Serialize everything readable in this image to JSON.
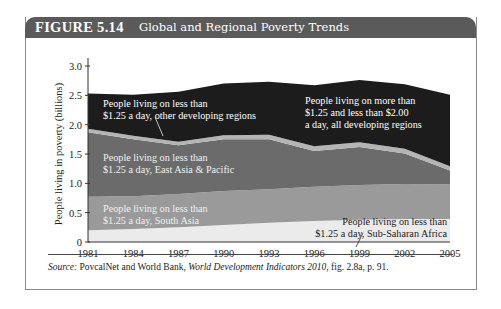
{
  "figure": {
    "number": "FIGURE 5.14",
    "title": "Global and Regional Poverty Trends",
    "header_color": "#5a5a5a"
  },
  "source": {
    "label": "Source:",
    "text_before": " PovcalNet and World Bank, ",
    "italic": "World Development Indicators 2010",
    "text_after": ", fig. 2.8a, p. 91."
  },
  "chart_data": {
    "type": "area",
    "stacked": true,
    "title": "Global and Regional Poverty Trends",
    "xlabel": "",
    "ylabel": "People living in poverty (billions)",
    "ylim": [
      0,
      3.0
    ],
    "yticks": [
      "0",
      "0.5",
      "1.0",
      "1.5",
      "2.0",
      "2.5",
      "3.0"
    ],
    "x": [
      1981,
      1984,
      1987,
      1990,
      1993,
      1996,
      1999,
      2002,
      2005
    ],
    "xtick_labels": [
      "1981",
      "1984",
      "1987",
      "1990",
      "1993",
      "1996",
      "1999",
      "2002",
      "2005"
    ],
    "grid": false,
    "legend_position": "inline labels",
    "series": [
      {
        "name": "People living on less than $1.25 a day, Sub-Saharan Africa",
        "label_lines": [
          "People living on less than",
          "$1.25 a day, Sub-Saharan Africa"
        ],
        "color": "#ebebeb",
        "values": [
          0.2,
          0.22,
          0.25,
          0.29,
          0.33,
          0.36,
          0.38,
          0.39,
          0.39
        ]
      },
      {
        "name": "People living on less than $1.25 a day, South Asia",
        "label_lines": [
          "People living on less than",
          "$1.25 a day, South Asia"
        ],
        "color": "#9a9a9a",
        "values": [
          0.57,
          0.56,
          0.57,
          0.58,
          0.57,
          0.58,
          0.59,
          0.6,
          0.59
        ]
      },
      {
        "name": "People living on less than $1.25 a day, East Asia & Pacific",
        "label_lines": [
          "People living on less than",
          "$1.25 a day, East Asia & Pacific"
        ],
        "color": "#6b6b6b",
        "values": [
          1.1,
          0.97,
          0.83,
          0.88,
          0.85,
          0.61,
          0.65,
          0.52,
          0.24
        ]
      },
      {
        "name": "People living on less than $1.25 a day, other developing regions",
        "label_lines": [
          "People living on less than",
          "$1.25 a day, other developing regions"
        ],
        "color": "#b4b4b4",
        "values": [
          0.06,
          0.06,
          0.06,
          0.07,
          0.08,
          0.08,
          0.08,
          0.08,
          0.07
        ]
      },
      {
        "name": "People living on more than $1.25 and less than $2.00 a day, all developing regions",
        "label_lines": [
          "People living on more than",
          "$1.25 and less than $2.00",
          "a day, all developing regions"
        ],
        "color": "#1c1c1c",
        "values": [
          0.6,
          0.7,
          0.85,
          0.88,
          0.9,
          1.04,
          1.06,
          1.1,
          1.22
        ]
      }
    ]
  }
}
